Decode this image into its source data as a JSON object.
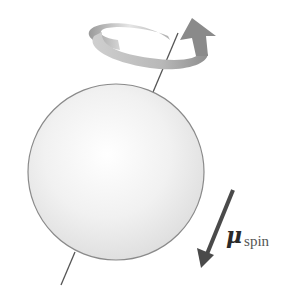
{
  "diagram": {
    "sphere": {
      "cx": 116,
      "cy": 172,
      "r": 88,
      "fill": "#f2f2f2",
      "stroke": "#8a8a8a"
    },
    "spin_axis": {
      "top": [
        178,
        33
      ],
      "bottom": [
        61,
        285
      ],
      "color": "#555555"
    },
    "rotation_arrow": {
      "color": "#a8a8a8",
      "direction": "counterclockwise-viewed-from-top"
    },
    "moment_arrow": {
      "from": [
        233,
        190
      ],
      "to": [
        202,
        268
      ],
      "color": "#4a4a4a"
    },
    "label": {
      "symbol": "μ",
      "subscript": "spin"
    }
  }
}
